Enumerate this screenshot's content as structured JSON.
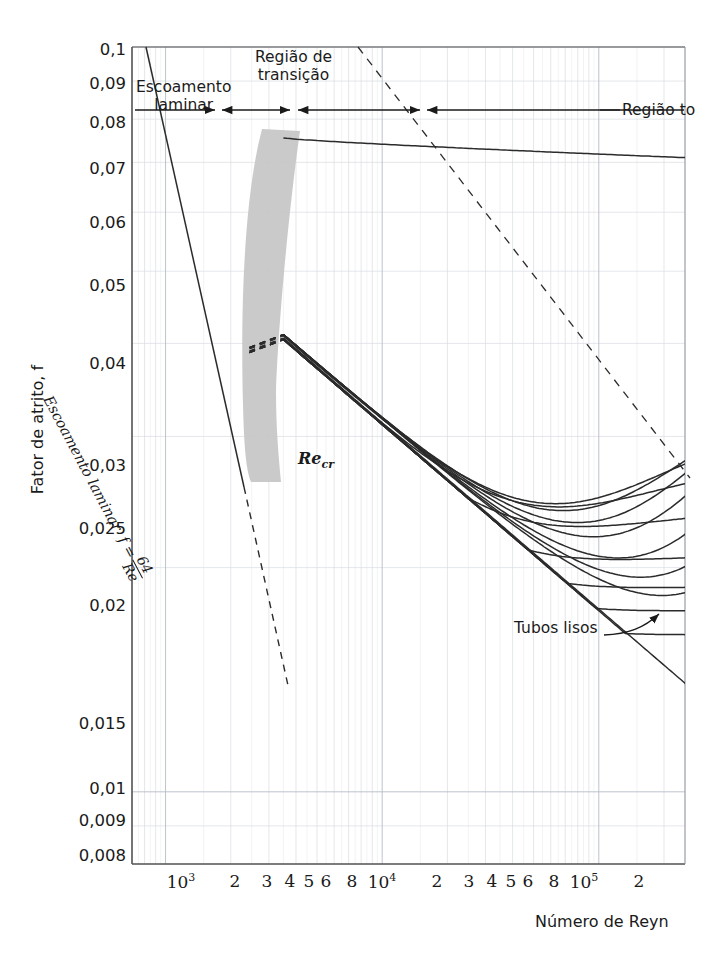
{
  "chart_data": {
    "type": "line",
    "title": "",
    "subtitle": "",
    "xlabel": "Número de Reyn",
    "ylabel": "Fator de atrito, f",
    "xscale": "log",
    "yscale": "log",
    "xlim": [
      700,
      250000
    ],
    "ylim": [
      0.008,
      0.1
    ],
    "grid": true,
    "legend": "none",
    "x_tick_labels": [
      {
        "value": 1000,
        "text": "10",
        "exp": "3"
      },
      {
        "value": 2000,
        "text": "2",
        "exp": ""
      },
      {
        "value": 3000,
        "text": "3",
        "exp": ""
      },
      {
        "value": 4000,
        "text": "4",
        "exp": ""
      },
      {
        "value": 5000,
        "text": "5",
        "exp": ""
      },
      {
        "value": 6000,
        "text": "6",
        "exp": ""
      },
      {
        "value": 8000,
        "text": "8",
        "exp": ""
      },
      {
        "value": 10000,
        "text": "10",
        "exp": "4"
      },
      {
        "value": 20000,
        "text": "2",
        "exp": ""
      },
      {
        "value": 30000,
        "text": "3",
        "exp": ""
      },
      {
        "value": 40000,
        "text": "4",
        "exp": ""
      },
      {
        "value": 50000,
        "text": "5",
        "exp": ""
      },
      {
        "value": 60000,
        "text": "6",
        "exp": ""
      },
      {
        "value": 80000,
        "text": "8",
        "exp": ""
      },
      {
        "value": 100000,
        "text": "10",
        "exp": "5"
      },
      {
        "value": 200000,
        "text": "2",
        "exp": ""
      }
    ],
    "y_tick_labels": [
      {
        "value": 0.1,
        "text": "0,1"
      },
      {
        "value": 0.09,
        "text": "0,09"
      },
      {
        "value": 0.08,
        "text": "0,08"
      },
      {
        "value": 0.07,
        "text": "0,07"
      },
      {
        "value": 0.06,
        "text": "0,06"
      },
      {
        "value": 0.05,
        "text": "0,05"
      },
      {
        "value": 0.04,
        "text": "0,04"
      },
      {
        "value": 0.03,
        "text": "0,03"
      },
      {
        "value": 0.025,
        "text": "0,025"
      },
      {
        "value": 0.02,
        "text": "0,02"
      },
      {
        "value": 0.015,
        "text": "0,015"
      },
      {
        "value": 0.01,
        "text": "0,01"
      },
      {
        "value": 0.009,
        "text": "0,009"
      },
      {
        "value": 0.008,
        "text": "0,008"
      }
    ],
    "annotations": [
      {
        "name": "laminar-flow",
        "text_line1": "Escoamento",
        "text_line2": "laminar"
      },
      {
        "name": "transition-region",
        "text_line1": "Região de",
        "text_line2": "transição"
      },
      {
        "name": "fully-turbulent-region",
        "text_line1": "Região to"
      },
      {
        "name": "smooth-pipes",
        "text_line1": "Tubos lisos"
      },
      {
        "name": "critical-reynolds",
        "text_line1": "Re",
        "sub": "cr"
      },
      {
        "name": "laminar-equation",
        "text_line1": "Escoamento laminar",
        "formula_lhs": "f =",
        "formula_num": "64",
        "formula_den": "Re"
      }
    ],
    "series": [
      {
        "name": "relative-roughness-curve-1",
        "plateau_f": 0.072,
        "smooth_merge_re": 3500
      },
      {
        "name": "relative-roughness-curve-2",
        "plateau_f": 0.0645,
        "smooth_merge_re": 3500
      },
      {
        "name": "relative-roughness-curve-3",
        "plateau_f": 0.057,
        "smooth_merge_re": 3500
      },
      {
        "name": "relative-roughness-curve-4",
        "plateau_f": 0.049,
        "smooth_merge_re": 3500
      },
      {
        "name": "relative-roughness-curve-5",
        "plateau_f": 0.0435,
        "smooth_merge_re": 3500
      },
      {
        "name": "relative-roughness-curve-6",
        "plateau_f": 0.0382,
        "smooth_merge_re": 3500
      },
      {
        "name": "relative-roughness-curve-7",
        "plateau_f": 0.033,
        "smooth_merge_re": 3500
      },
      {
        "name": "relative-roughness-curve-8",
        "plateau_f": 0.0285,
        "smooth_merge_re": 3500
      },
      {
        "name": "relative-roughness-curve-9",
        "plateau_f": 0.0243,
        "smooth_merge_re": 3500
      },
      {
        "name": "relative-roughness-curve-10",
        "plateau_f": 0.021,
        "smooth_merge_re": 3500
      },
      {
        "name": "relative-roughness-curve-11",
        "plateau_f": 0.019,
        "smooth_merge_re": 3500
      },
      {
        "name": "relative-roughness-curve-12",
        "plateau_f": 0.0176,
        "smooth_merge_re": 3500
      },
      {
        "name": "relative-roughness-curve-13",
        "plateau_f": 0.0163,
        "smooth_merge_re": 3500
      },
      {
        "name": "smooth-pipe-curve",
        "plateau_f": 0.015,
        "smooth_merge_re": 3500
      }
    ],
    "laminar_line": {
      "equation": "f = 64/Re",
      "from_re": 700,
      "to_re": 2300
    },
    "laminar_dashed_extension": {
      "from_re": 2300,
      "to_re": 5200
    },
    "transition_band": {
      "re_start": 2300,
      "re_end": 4000
    },
    "fully_turbulent_dashed_boundary": {
      "from_re": 9000,
      "from_f": 0.075,
      "to_re": 250000,
      "to_f": 0.0285
    },
    "region_markers": [
      "laminar",
      "transition",
      "fully-turbulent"
    ]
  }
}
